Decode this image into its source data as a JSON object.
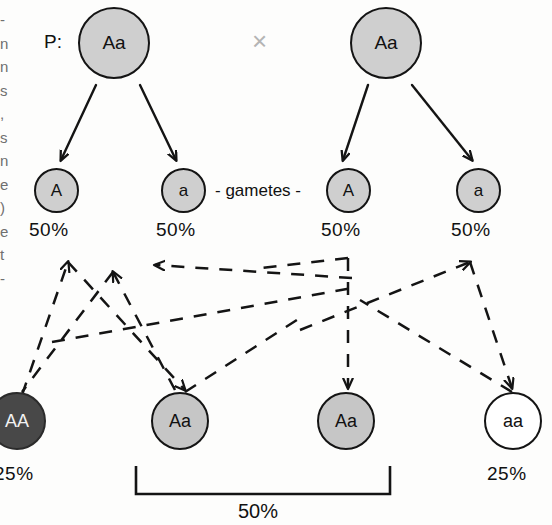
{
  "figure": {
    "background_color": "#fdfdfc"
  },
  "labels": {
    "parent_generation_tag": "P:",
    "cross_symbol": "×",
    "gametes_tag": "- gametes -",
    "bracket_total": "50%"
  },
  "parents": [
    {
      "genotype": "Aa",
      "fill": "#cfcfcf"
    },
    {
      "genotype": "Aa",
      "fill": "#cfcfcf"
    }
  ],
  "gametes": [
    {
      "allele": "A",
      "percent": "50%",
      "fill": "#cfcfcf"
    },
    {
      "allele": "a",
      "percent": "50%",
      "fill": "#cfcfcf"
    },
    {
      "allele": "A",
      "percent": "50%",
      "fill": "#cfcfcf"
    },
    {
      "allele": "a",
      "percent": "50%",
      "fill": "#cfcfcf"
    }
  ],
  "offspring": [
    {
      "genotype": "AA",
      "percent": "25%",
      "fill": "#484848",
      "text_color": "#f2f2f2"
    },
    {
      "genotype": "Aa",
      "percent": "",
      "fill": "#c6c6c6",
      "text_color": "#111111"
    },
    {
      "genotype": "Aa",
      "percent": "",
      "fill": "#c6c6c6",
      "text_color": "#111111"
    },
    {
      "genotype": "aa",
      "percent": "25%",
      "fill": "#ffffff",
      "text_color": "#111111"
    }
  ],
  "margin_text_fragments": [
    "-",
    "n",
    "n",
    "s",
    ",",
    "s",
    "n",
    "e",
    ")",
    "e",
    "t",
    "-"
  ],
  "colors": {
    "stroke": "#141414",
    "heterozygous_fill": "#cfcfcf",
    "homozygous_dominant_fill": "#484848",
    "homozygous_recessive_fill": "#ffffff",
    "cross_symbol_color": "#b4b4b4"
  }
}
